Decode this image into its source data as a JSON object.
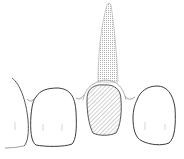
{
  "figure": {
    "type": "dental-illustration",
    "colors": {
      "background": "#ffffff",
      "outline": "#3a3a3a",
      "soft_outline": "#9a9a9a",
      "post_fill": "#d8d8d8",
      "crown_hatch": "#8a8a8a"
    },
    "parts": [
      {
        "id": "post",
        "label": "Post (stippled)"
      },
      {
        "id": "crown",
        "label": "Crown (hatched)"
      },
      {
        "id": "left-tooth",
        "label": "Adjacent tooth (left)"
      },
      {
        "id": "right-tooth",
        "label": "Adjacent tooth (right)"
      },
      {
        "id": "lateral-left",
        "label": "Partial tooth outline (far left)"
      },
      {
        "id": "gingiva",
        "label": "Gingival line"
      }
    ]
  }
}
